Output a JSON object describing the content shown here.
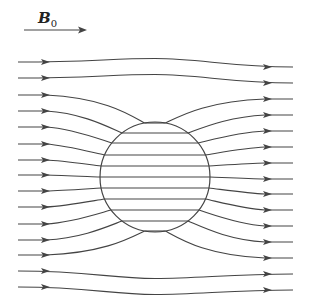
{
  "diagram": {
    "title_label": "B",
    "title_subscript": "0",
    "reference_arrow": {
      "x1": 24,
      "y1": 30,
      "x2": 84,
      "y2": 30
    },
    "colors": {
      "line": "#444444",
      "background": "#ffffff"
    },
    "sphere": {
      "cx": 155,
      "cy": 177,
      "r": 55
    },
    "field_lines": [
      {
        "yl": 62,
        "yr": 67,
        "inside": null
      },
      {
        "yl": 78,
        "yr": 83,
        "inside": null
      },
      {
        "yl": 95,
        "yr": 99,
        "inside": 123
      },
      {
        "yl": 111,
        "yr": 115,
        "inside": 133
      },
      {
        "yl": 127,
        "yr": 131,
        "inside": 143
      },
      {
        "yl": 144,
        "yr": 147,
        "inside": 155
      },
      {
        "yl": 160,
        "yr": 163,
        "inside": 166
      },
      {
        "yl": 175,
        "yr": 179,
        "inside": 177
      },
      {
        "yl": 191,
        "yr": 194,
        "inside": 188
      },
      {
        "yl": 207,
        "yr": 210,
        "inside": 199
      },
      {
        "yl": 224,
        "yr": 226,
        "inside": 210
      },
      {
        "yl": 240,
        "yr": 242,
        "inside": 221
      },
      {
        "yl": 255,
        "yr": 258,
        "inside": 231
      },
      {
        "yl": 271,
        "yr": 274,
        "inside": null
      },
      {
        "yl": 287,
        "yr": 290,
        "inside": null
      }
    ]
  }
}
